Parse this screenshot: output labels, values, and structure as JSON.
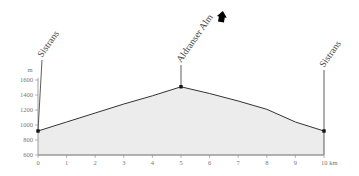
{
  "chart_data": {
    "type": "area",
    "title": "",
    "xlabel": "km",
    "ylabel": "m",
    "x_ticks": [
      "0",
      "1",
      "2",
      "3",
      "4",
      "5",
      "6",
      "7",
      "8",
      "9",
      "10 km"
    ],
    "y_ticks": [
      "600",
      "800",
      "1000",
      "1200",
      "1400",
      "1600"
    ],
    "xlim": [
      0,
      10
    ],
    "ylim": [
      600,
      1600
    ],
    "grid": false,
    "legend": null,
    "series": [
      {
        "name": "Elevation profile",
        "x": [
          0,
          1,
          2,
          3,
          4,
          5,
          6,
          7,
          8,
          9,
          10
        ],
        "y": [
          920,
          1040,
          1160,
          1280,
          1390,
          1510,
          1420,
          1320,
          1210,
          1040,
          920
        ]
      }
    ],
    "waypoints": [
      {
        "label": "Sistrans",
        "km": 0,
        "elevation": 920,
        "icon": ""
      },
      {
        "label": "Aldranser Alm",
        "km": 5,
        "elevation": 1510,
        "icon": "alpine-hut-icon"
      },
      {
        "label": "Sistrans",
        "km": 10,
        "elevation": 920,
        "icon": ""
      }
    ],
    "colors": {
      "fill": "#ececec",
      "line": "#333333",
      "axis": "#888888",
      "marker": "#111111"
    }
  }
}
